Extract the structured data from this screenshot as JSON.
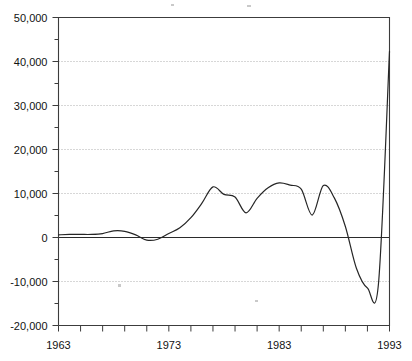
{
  "chart_data": {
    "type": "line",
    "title": "",
    "subtitle": "",
    "xlabel": "",
    "ylabel": "",
    "xlim": [
      1963,
      1993
    ],
    "ylim": [
      -20000,
      50000
    ],
    "grid": true,
    "legend": false,
    "y_ticks": [
      -20000,
      -10000,
      0,
      10000,
      20000,
      30000,
      40000,
      50000
    ],
    "y_tick_labels": [
      "-20,000",
      "-10,000",
      "0",
      "10,000",
      "20,000",
      "30,000",
      "40,000",
      "50,000"
    ],
    "y_minor_tick_step": 5000,
    "x_ticks": [
      1963,
      1965,
      1967,
      1969,
      1971,
      1973,
      1975,
      1977,
      1979,
      1981,
      1983,
      1985,
      1987,
      1989,
      1991,
      1993
    ],
    "x_tick_labels": [
      "1963",
      "",
      "",
      "",
      "",
      "1973",
      "",
      "",
      "",
      "",
      "1983",
      "",
      "",
      "",
      "",
      "1993"
    ],
    "x_labeled_ticks": [
      1963,
      1973,
      1983,
      1993
    ],
    "zero_line": 0,
    "series": [
      {
        "name": "series-1",
        "color": "#262626",
        "x": [
          1963,
          1964,
          1965,
          1966,
          1967,
          1968,
          1969,
          1970,
          1971,
          1972,
          1973,
          1974,
          1975,
          1976,
          1977,
          1978,
          1979,
          1980,
          1981,
          1982,
          1983,
          1984,
          1985,
          1986,
          1987,
          1988,
          1989,
          1990,
          1991,
          1992,
          1993
        ],
        "values": [
          600,
          700,
          700,
          700,
          900,
          1500,
          1400,
          600,
          -600,
          -400,
          900,
          2200,
          4500,
          7800,
          11500,
          9800,
          9200,
          5600,
          8900,
          11300,
          12400,
          11900,
          11000,
          5100,
          11800,
          9000,
          2500,
          -7000,
          -11500,
          -10500,
          42300
        ]
      }
    ]
  },
  "axes": {
    "y_axis_name": "y-axis",
    "x_axis_name": "x-axis"
  }
}
